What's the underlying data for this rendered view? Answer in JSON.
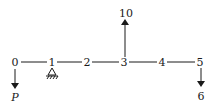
{
  "diagram": {
    "type": "beam-load-diagram",
    "nodes": [
      {
        "id": "0",
        "label": "0",
        "x": 15
      },
      {
        "id": "1",
        "label": "1",
        "x": 52
      },
      {
        "id": "2",
        "label": "2",
        "x": 87
      },
      {
        "id": "3",
        "label": "3",
        "x": 124
      },
      {
        "id": "4",
        "label": "4",
        "x": 162
      },
      {
        "id": "5",
        "label": "5",
        "x": 200
      }
    ],
    "support": {
      "node": "1",
      "type": "pin-support"
    },
    "loads": [
      {
        "node": "0",
        "direction": "down",
        "label": "P"
      },
      {
        "node": "3",
        "direction": "up",
        "label": "10"
      },
      {
        "node": "5",
        "direction": "down",
        "label": "6"
      }
    ],
    "color": "#1a1a1a"
  }
}
